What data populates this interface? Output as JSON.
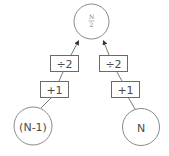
{
  "diagram": {
    "title": "",
    "nodes": {
      "top": {
        "numerator": "N",
        "denominator": "2",
        "label": "N/2"
      },
      "left": {
        "label": "(N-1)"
      },
      "right": {
        "label": "N"
      }
    },
    "operations": {
      "left_divide": {
        "label": "÷2"
      },
      "left_add": {
        "label": "+1"
      },
      "right_divide": {
        "label": "÷2"
      },
      "right_add": {
        "label": "+1"
      }
    },
    "edges": [
      {
        "from": "left",
        "to": "left_add"
      },
      {
        "from": "left_add",
        "to": "left_divide"
      },
      {
        "from": "left_divide",
        "to": "top",
        "arrow": true
      },
      {
        "from": "right",
        "to": "right_add"
      },
      {
        "from": "right_add",
        "to": "right_divide"
      },
      {
        "from": "right_divide",
        "to": "top",
        "arrow": true
      }
    ],
    "colors": {
      "stroke": "#6a6a6a",
      "circle_stroke": "#8a8a8a",
      "text": "#4a4a4a",
      "background": "#ffffff"
    }
  }
}
